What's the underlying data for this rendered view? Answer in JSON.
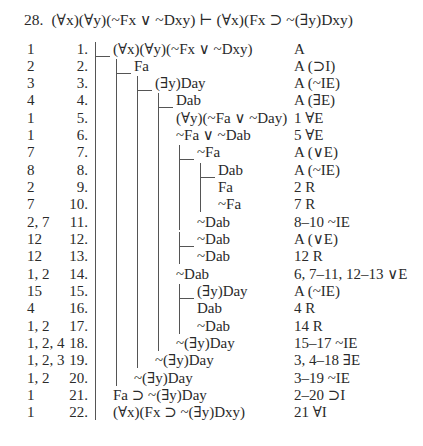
{
  "title": {
    "number": "28.",
    "sequent": "(∀x)(∀y)(~Fx ∨ ~Dxy) ⊢ (∀x)(Fx ⊃ ~(∃y)Dxy)"
  },
  "rows": [
    {
      "deps": "1",
      "line": "1.",
      "formula": "(∀x)(∀y)(~Fx ∨ ~Dxy)",
      "just": "A",
      "level": 1
    },
    {
      "deps": "2",
      "line": "2.",
      "formula": "Fa",
      "just": "A (⊃I)",
      "level": 2
    },
    {
      "deps": "3",
      "line": "3.",
      "formula": "(∃y)Day",
      "just": "A (~IE)",
      "level": 3
    },
    {
      "deps": "4",
      "line": "4.",
      "formula": "Dab",
      "just": "A (∃E)",
      "level": 4
    },
    {
      "deps": "1",
      "line": "5.",
      "formula": "(∀y)(~Fa ∨ ~Day)",
      "just": "1 ∀E",
      "level": 4
    },
    {
      "deps": "1",
      "line": "6.",
      "formula": "~Fa ∨ ~Dab",
      "just": "5 ∀E",
      "level": 4
    },
    {
      "deps": "7",
      "line": "7.",
      "formula": "~Fa",
      "just": "A (∨E)",
      "level": 5
    },
    {
      "deps": "8",
      "line": "8.",
      "formula": "Dab",
      "just": "A (~IE)",
      "level": 6
    },
    {
      "deps": "2",
      "line": "9.",
      "formula": "Fa",
      "just": "2 R",
      "level": 6
    },
    {
      "deps": "7",
      "line": "10.",
      "formula": "~Fa",
      "just": "7 R",
      "level": 6
    },
    {
      "deps": "2, 7",
      "line": "11.",
      "formula": "~Dab",
      "just": "8–10 ~IE",
      "level": 5
    },
    {
      "deps": "12",
      "line": "12.",
      "formula": "~Dab",
      "just": "A (∨E)",
      "level": 5
    },
    {
      "deps": "12",
      "line": "13.",
      "formula": "~Dab",
      "just": "12 R",
      "level": 5
    },
    {
      "deps": "1, 2",
      "line": "14.",
      "formula": "~Dab",
      "just": "6, 7–11, 12–13 ∨E",
      "level": 4
    },
    {
      "deps": "15",
      "line": "15.",
      "formula": "(∃y)Day",
      "just": "A (~IE)",
      "level": 5
    },
    {
      "deps": "4",
      "line": "16.",
      "formula": "Dab",
      "just": "4 R",
      "level": 5
    },
    {
      "deps": "1, 2",
      "line": "17.",
      "formula": "~Dab",
      "just": "14 R",
      "level": 5
    },
    {
      "deps": "1, 2, 4",
      "line": "18.",
      "formula": "~(∃y)Day",
      "just": "15–17 ~IE",
      "level": 4
    },
    {
      "deps": "1, 2, 3",
      "line": "19.",
      "formula": "~(∃y)Day",
      "just": "3, 4–18 ∃E",
      "level": 3
    },
    {
      "deps": "1, 2",
      "line": "20.",
      "formula": "~(∃y)Day",
      "just": "3–19 ~IE",
      "level": 2
    },
    {
      "deps": "1",
      "line": "21.",
      "formula": "Fa ⊃ ~(∃y)Day",
      "just": "2–20 ⊃I",
      "level": 1
    },
    {
      "deps": "1",
      "line": "22.",
      "formula": "(∀x)(Fx ⊃ ~(∃y)Dxy)",
      "just": "21 ∀I",
      "level": 1
    }
  ],
  "scopes": [
    {
      "level": 1,
      "from": 1,
      "to": 22
    },
    {
      "level": 2,
      "from": 2,
      "to": 20
    },
    {
      "level": 3,
      "from": 3,
      "to": 19
    },
    {
      "level": 4,
      "from": 4,
      "to": 18
    },
    {
      "level": 5,
      "from": 7,
      "to": 11
    },
    {
      "level": 6,
      "from": 8,
      "to": 10
    },
    {
      "level": 5,
      "from": 12,
      "to": 13
    },
    {
      "level": 5,
      "from": 15,
      "to": 17
    }
  ]
}
